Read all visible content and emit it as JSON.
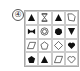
{
  "question_label": "④",
  "grid": {
    "rows": [
      [
        "filled-triangle",
        "hourglass-outline",
        "filled-triangle",
        "folded-square-outline"
      ],
      [
        "bowtie-filled",
        "concentric-circles",
        "filled-heptagon",
        "filled-inverted-triangle"
      ],
      [
        "parallelogram-outline",
        "pentagon-outline",
        "diamond-outline",
        "filled-heart"
      ],
      [
        "filled-pentagon",
        "filled-triangle",
        "parallelogram-outline",
        "heart-outline"
      ]
    ]
  },
  "colors": {
    "shape": "#111111",
    "grid_line": "#cccccc"
  }
}
